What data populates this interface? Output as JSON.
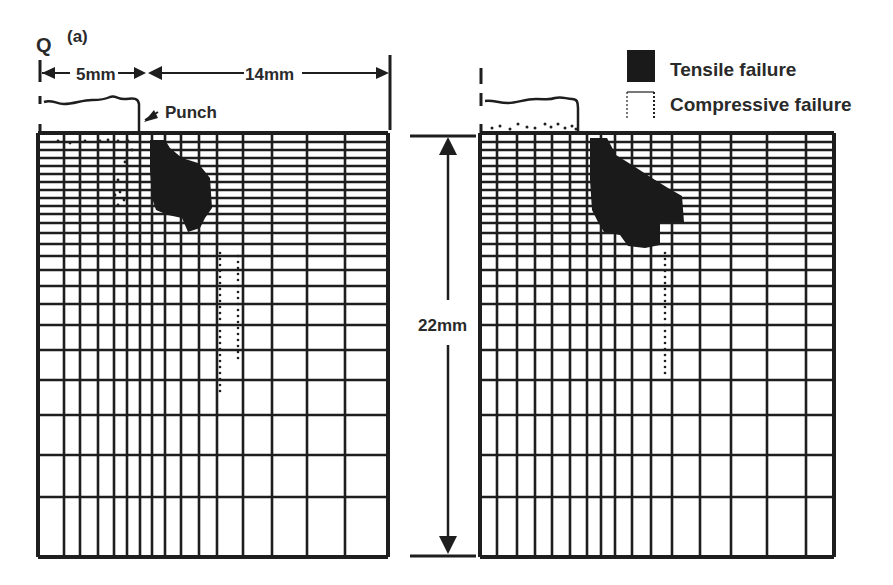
{
  "figure": {
    "panel_letter": "Q",
    "subfigure_label": "(a)",
    "dim_left_label": "5mm",
    "dim_right_label": "14mm",
    "dim_vertical_label": "22mm",
    "punch_label": "Punch"
  },
  "legend": {
    "items": [
      {
        "label": "Tensile failure",
        "symbol": "filled-square"
      },
      {
        "label": "Compressive failure",
        "symbol": "dotted-bracket"
      }
    ]
  },
  "colors": {
    "ink": "#1e1e1e",
    "fill": "#1a1a1a",
    "background": "#ffffff"
  },
  "mesh": {
    "left_panel": {
      "x0": 38,
      "x1": 388,
      "y0": 133,
      "y1": 557,
      "vlines": [
        38,
        64,
        80,
        98,
        114,
        127,
        140,
        152,
        165,
        181,
        199,
        217,
        243,
        272,
        307,
        345,
        388
      ],
      "hlines": [
        133,
        142,
        150,
        158,
        166,
        174,
        182,
        190,
        198,
        206,
        214,
        223,
        233,
        244,
        256,
        270,
        286,
        304,
        325,
        350,
        380,
        415,
        455,
        497,
        557
      ]
    },
    "right_panel": {
      "x0": 480,
      "x1": 834,
      "y0": 133,
      "y1": 557,
      "vlines": [
        480,
        497,
        517,
        535,
        552,
        570,
        587,
        601,
        615,
        632,
        651,
        672,
        700,
        731,
        767,
        806,
        834
      ],
      "hlines": [
        133,
        142,
        150,
        158,
        166,
        174,
        182,
        190,
        198,
        206,
        214,
        223,
        233,
        244,
        256,
        270,
        286,
        304,
        325,
        350,
        380,
        415,
        455,
        497,
        557
      ]
    }
  },
  "failure_zones": {
    "left_tensile": "150,140 165,140 170,148 182,158 198,163 210,178 212,208 205,218 200,228 188,232 182,218 168,215 156,210 152,198 150,170",
    "right_tensile": "590,138 607,138 616,155 632,165 652,178 668,188 682,196 684,222 660,222 660,245 645,248 628,246 620,235 604,232 598,222 592,210 590,180",
    "left_compressive_dots_top": [
      [
        58,
        141
      ],
      [
        70,
        143
      ],
      [
        85,
        141
      ],
      [
        100,
        141
      ],
      [
        108,
        140
      ],
      [
        118,
        141
      ],
      [
        128,
        141
      ],
      [
        132,
        150
      ],
      [
        125,
        162
      ],
      [
        118,
        180
      ],
      [
        115,
        195
      ],
      [
        120,
        192
      ],
      [
        124,
        200
      ],
      [
        118,
        205
      ]
    ],
    "left_compressive_column": {
      "x": 220,
      "x2": 238,
      "y_start": 253,
      "y_end": 392
    },
    "right_compressive_dots_top": [
      [
        492,
        128
      ],
      [
        500,
        126
      ],
      [
        510,
        129
      ],
      [
        518,
        124
      ],
      [
        527,
        127
      ],
      [
        535,
        128
      ],
      [
        545,
        124
      ],
      [
        551,
        127
      ],
      [
        558,
        124
      ],
      [
        565,
        128
      ],
      [
        572,
        126
      ],
      [
        576,
        129
      ]
    ],
    "right_compressive_column": {
      "x": 665,
      "y_start": 253,
      "y_end": 378
    }
  }
}
